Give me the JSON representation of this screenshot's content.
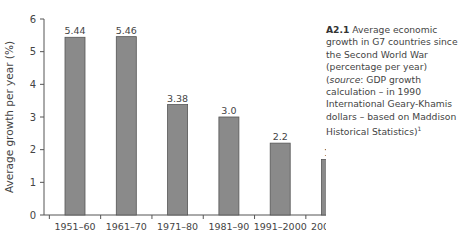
{
  "chart_data": {
    "type": "bar",
    "title": "",
    "xlabel": "",
    "ylabel": "Average growth per year (%)",
    "categories": [
      "1951–60",
      "1961–70",
      "1971–80",
      "1981–90",
      "1991–2000",
      "2001–10"
    ],
    "values": [
      5.44,
      5.46,
      3.38,
      3.0,
      2.2,
      1.7
    ],
    "value_labels": [
      "5.44",
      "5.46",
      "3.38",
      "3.0",
      "2.2",
      "1.7"
    ],
    "ylim": [
      0,
      6
    ],
    "yticks": [
      0,
      1,
      2,
      3,
      4,
      5,
      6
    ],
    "grid": false,
    "legend": null,
    "bar_color": "#8a8a8a",
    "bar_edge_color": "#555555"
  },
  "caption": {
    "label": "A2.1",
    "text_plain": "Average economic growth in G7 countries since the Second World War (percentage per year) (",
    "source_word": "source",
    "text_rest": ": GDP growth calculation – in 1990 International Geary-Khamis dollars – based on Maddison Historical Statistics)",
    "footnote": "1"
  }
}
